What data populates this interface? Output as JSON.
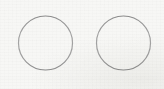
{
  "image": {
    "kind": "scanned-drawing",
    "width": 164,
    "height": 89,
    "background_color": "#f7f7f5",
    "alt_text": "Two hand-drawn circle outlines side by side on off-white paper",
    "caption": ""
  },
  "palette": {
    "paper": "#f7f7f5",
    "paper_highlight": "#fdfdfc",
    "stroke": "#9a9a9a",
    "stroke_dark": "#8a8a8a",
    "stroke_light": "#b4b4b2",
    "smudge": "#ededea"
  },
  "shapes": [
    {
      "id": "circle-left",
      "name": "left-circle",
      "type": "circle",
      "cx": 45.5,
      "cy": 43,
      "r": 27,
      "stroke": "#9a9a9a",
      "stroke_width": 1.2,
      "fill": "none",
      "label": ""
    },
    {
      "id": "circle-right",
      "name": "right-circle",
      "type": "circle",
      "cx": 123.5,
      "cy": 43,
      "r": 27,
      "stroke": "#9a9a9a",
      "stroke_width": 1.2,
      "fill": "none",
      "label": ""
    }
  ],
  "artifacts": {
    "scan_band": {
      "top": 74,
      "height": 10,
      "opacity": 0.35
    },
    "grain_opacity": 0.9
  },
  "annotations": {
    "count": 0,
    "items": []
  }
}
